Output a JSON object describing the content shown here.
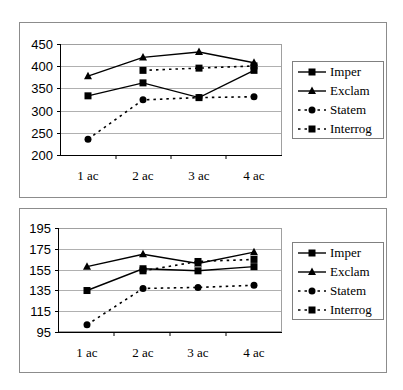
{
  "chart_data": [
    {
      "type": "line",
      "title": "",
      "xlabel": "",
      "ylabel": "",
      "categories": [
        "1 ac",
        "2 ac",
        "3 ac",
        "4 ac"
      ],
      "ylim": [
        200,
        450
      ],
      "yticks": [
        200,
        250,
        300,
        350,
        400,
        450
      ],
      "grid": true,
      "legend_position": "right",
      "series": [
        {
          "name": "Imper",
          "style": "solid",
          "marker": "square",
          "values": [
            334,
            363,
            330,
            391
          ]
        },
        {
          "name": "Exclam",
          "style": "solid",
          "marker": "triangle",
          "values": [
            378,
            420,
            432,
            408
          ]
        },
        {
          "name": "Statem",
          "style": "dotted",
          "marker": "circle",
          "values": [
            237,
            325,
            330,
            332
          ]
        },
        {
          "name": "Interrog",
          "style": "dotted",
          "marker": "square",
          "values": [
            null,
            391,
            396,
            401
          ]
        }
      ]
    },
    {
      "type": "line",
      "title": "",
      "xlabel": "",
      "ylabel": "",
      "categories": [
        "1 ac",
        "2 ac",
        "3 ac",
        "4 ac"
      ],
      "ylim": [
        95,
        195
      ],
      "yticks": [
        95,
        115,
        135,
        155,
        175,
        195
      ],
      "grid": true,
      "legend_position": "right",
      "series": [
        {
          "name": "Imper",
          "style": "solid",
          "marker": "square",
          "values": [
            135,
            156,
            154,
            158
          ]
        },
        {
          "name": "Exclam",
          "style": "solid",
          "marker": "triangle",
          "values": [
            158,
            170,
            161,
            172
          ]
        },
        {
          "name": "Statem",
          "style": "dotted",
          "marker": "circle",
          "values": [
            102,
            137,
            138,
            140
          ]
        },
        {
          "name": "Interrog",
          "style": "dotted",
          "marker": "square",
          "values": [
            null,
            154,
            163,
            165
          ]
        }
      ]
    }
  ],
  "charts": [
    {
      "yticks": [
        "450",
        "400",
        "350",
        "300",
        "250",
        "200"
      ],
      "xcats": [
        "1 ac",
        "2 ac",
        "3 ac",
        "4 ac"
      ],
      "legend": [
        "Imper",
        "Exclam",
        "Statem",
        "Interrog"
      ]
    },
    {
      "yticks": [
        "195",
        "175",
        "155",
        "135",
        "115",
        "95"
      ],
      "xcats": [
        "1 ac",
        "2 ac",
        "3 ac",
        "4 ac"
      ],
      "legend": [
        "Imper",
        "Exclam",
        "Statem",
        "Interrog"
      ]
    }
  ]
}
